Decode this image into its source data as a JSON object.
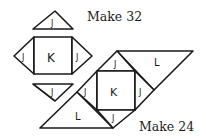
{
  "diagram": {
    "captions": {
      "top": "Make 32",
      "bottom": "Make 24"
    },
    "unit_pieces": [
      {
        "id": "top-triangle",
        "label": "J"
      },
      {
        "id": "left-triangle",
        "label": "J"
      },
      {
        "id": "center-square",
        "label": "K"
      },
      {
        "id": "right-triangle",
        "label": "J"
      },
      {
        "id": "bottom-triangle",
        "label": "J"
      }
    ],
    "assembled_block": [
      {
        "id": "top-triangle",
        "label": "J"
      },
      {
        "id": "left-triangle",
        "label": "J"
      },
      {
        "id": "center-square",
        "label": "K"
      },
      {
        "id": "right-triangle",
        "label": "J"
      },
      {
        "id": "bottom-triangle",
        "label": "J"
      },
      {
        "id": "upper-right-large-triangle",
        "label": "L"
      },
      {
        "id": "lower-left-large-triangle",
        "label": "L"
      }
    ]
  }
}
